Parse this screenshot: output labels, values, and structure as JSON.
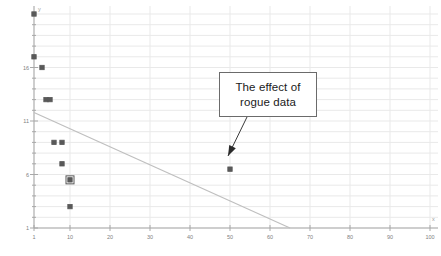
{
  "chart_data": {
    "type": "scatter",
    "title": "",
    "xlabel": "x",
    "ylabel": "y",
    "xlim": [
      1,
      100
    ],
    "ylim": [
      1,
      21
    ],
    "grid": true,
    "legend": "none",
    "xticks": [
      1,
      10,
      20,
      30,
      40,
      50,
      60,
      70,
      80,
      90,
      100
    ],
    "xticklabels": [
      "1",
      "10",
      "20",
      "30",
      "40",
      "50",
      "60",
      "70",
      "80",
      "90",
      "100"
    ],
    "yticks": [
      1,
      6,
      11,
      16
    ],
    "yticklabels": [
      "1",
      "6",
      "11",
      "16"
    ],
    "series": [
      {
        "name": "data",
        "marker": "square",
        "color": "#595959",
        "points": [
          {
            "x": 1,
            "y": 21.0,
            "rogue": false
          },
          {
            "x": 1,
            "y": 17.0,
            "rogue": false
          },
          {
            "x": 3,
            "y": 16.0,
            "rogue": false
          },
          {
            "x": 4,
            "y": 13.0,
            "rogue": false
          },
          {
            "x": 5,
            "y": 13.0,
            "rogue": false
          },
          {
            "x": 6,
            "y": 9.0,
            "rogue": false
          },
          {
            "x": 8,
            "y": 9.0,
            "rogue": false
          },
          {
            "x": 8,
            "y": 7.0,
            "rogue": false
          },
          {
            "x": 10,
            "y": 5.5,
            "rogue": false
          },
          {
            "x": 10,
            "y": 3.0,
            "rogue": false
          },
          {
            "x": 50,
            "y": 6.5,
            "rogue": true
          }
        ]
      }
    ],
    "trendline": {
      "name": "linear fit",
      "color": "#bfbfbf",
      "start": {
        "x": 1,
        "y": 11.8
      },
      "end": {
        "x": 65,
        "y": 1.0
      }
    },
    "annotations": [
      {
        "id": "rogue-callout",
        "lines": [
          "The effect of",
          "rogue data"
        ],
        "box": {
          "x": 219,
          "y": 72,
          "width": 98,
          "height": 45
        },
        "arrow_from": {
          "x": 247,
          "y": 117
        },
        "arrow_to": {
          "x": 228,
          "y": 156
        }
      }
    ]
  },
  "colors": {
    "background": "#ffffff",
    "grid": "#e9e9e9",
    "axis": "#a8a8a8",
    "marker": "#595959",
    "trendline": "#bfbfbf",
    "annotation_border": "#6b6b6b",
    "annotation_text": "#1a1a1a",
    "tick_text": "#808080"
  }
}
